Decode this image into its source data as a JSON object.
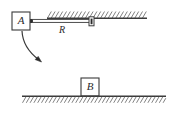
{
  "figure": {
    "background_color": "#ffffff",
    "stroke_color": "#3a3a3a",
    "label_color": "#2b2b2b",
    "block_fill": "#ffffff"
  },
  "labels": {
    "block_a": "A",
    "block_b": "B",
    "rod": "R"
  },
  "geometry": {
    "ceiling": {
      "x1": 47,
      "x2": 147,
      "y": 18,
      "hatch_side": "above",
      "hatch_count": 26
    },
    "ground": {
      "x1": 22,
      "x2": 166,
      "y": 96,
      "hatch_side": "below",
      "hatch_count": 37
    },
    "block_a": {
      "x": 12,
      "y": 12,
      "w": 18,
      "h": 18
    },
    "block_b": {
      "x": 81,
      "y": 78,
      "w": 18,
      "h": 18
    },
    "rod": {
      "x1": 30,
      "x2": 91,
      "y": 21
    },
    "pivot_dot": {
      "cx": 31,
      "cy": 21,
      "r": 2
    },
    "slider": {
      "x": 89,
      "y": 17,
      "w": 5,
      "h": 9
    },
    "arrow": {
      "start_x": 22,
      "start_y": 31,
      "end_x": 41,
      "end_y": 62
    }
  }
}
